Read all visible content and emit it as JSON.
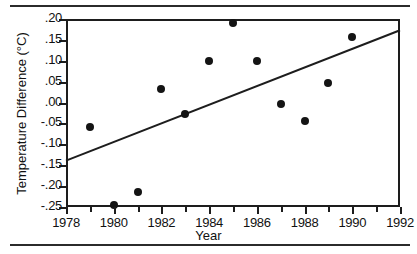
{
  "chart_data": {
    "type": "scatter",
    "title": "",
    "xlabel": "Year",
    "ylabel": "Temperature Difference (°C)",
    "xlim": [
      1978,
      1992
    ],
    "ylim": [
      -0.25,
      0.2
    ],
    "grid": false,
    "legend": "none",
    "x_tick_labels": [
      "1978",
      "1980",
      "1982",
      "1984",
      "1986",
      "1988",
      "1990",
      "1992"
    ],
    "x_tick_values": [
      1978,
      1980,
      1982,
      1984,
      1986,
      1988,
      1990,
      1992
    ],
    "x_minor_ticks": [
      1979,
      1981,
      1983,
      1985,
      1987,
      1989,
      1991
    ],
    "y_tick_labels": [
      ".20",
      ".15",
      ".10",
      ".05",
      ".00",
      "-.05",
      "-.10",
      "-.15",
      "-.20",
      "-.25"
    ],
    "y_tick_values": [
      0.2,
      0.15,
      0.1,
      0.05,
      0.0,
      -0.05,
      -0.1,
      -0.15,
      -0.2,
      -0.25
    ],
    "points": [
      {
        "x": 1979.0,
        "y": -0.058
      },
      {
        "x": 1980.0,
        "y": -0.245
      },
      {
        "x": 1981.0,
        "y": -0.213
      },
      {
        "x": 1982.0,
        "y": 0.033
      },
      {
        "x": 1983.0,
        "y": -0.028
      },
      {
        "x": 1984.0,
        "y": 0.1
      },
      {
        "x": 1985.0,
        "y": 0.19
      },
      {
        "x": 1986.0,
        "y": 0.1
      },
      {
        "x": 1987.0,
        "y": -0.003
      },
      {
        "x": 1988.0,
        "y": -0.043
      },
      {
        "x": 1989.0,
        "y": 0.047
      },
      {
        "x": 1990.0,
        "y": 0.158
      }
    ],
    "trend_line": {
      "x_start": 1978,
      "y_start": -0.139,
      "x_end": 1992,
      "y_end": 0.173
    },
    "marker_color": "#141414",
    "line_color": "#1d1d1d",
    "axis_color": "#1d1d1d",
    "background_color": "#ffffff"
  }
}
